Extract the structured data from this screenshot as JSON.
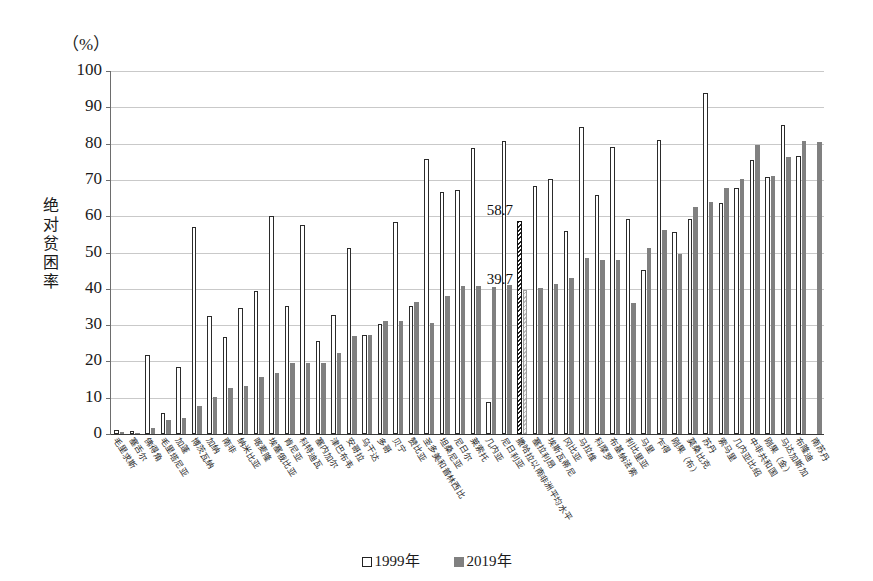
{
  "chart_data": {
    "type": "bar",
    "title": "",
    "unit_label": "（%）",
    "ylabel": "绝对贫困率",
    "xlabel": "",
    "ylim": [
      0,
      100
    ],
    "ytick_labels": [
      "0",
      "10",
      "20",
      "30",
      "40",
      "50",
      "60",
      "70",
      "80",
      "90",
      "100"
    ],
    "grid": true,
    "legend_position": "bottom",
    "legend": [
      "1999年",
      "2019年"
    ],
    "annotations": [
      {
        "category": "撒哈拉以南非洲平均水平",
        "series": "1999年",
        "value": 58.7,
        "text": "58.7"
      },
      {
        "category": "撒哈拉以南非洲平均水平",
        "series": "2019年",
        "value": 39.7,
        "text": "39.7"
      }
    ],
    "highlight_category": "撒哈拉以南非洲平均水平",
    "categories": [
      "毛里求斯",
      "塞舌尔",
      "佛得角",
      "毛里塔尼亚",
      "加蓬",
      "博茨瓦纳",
      "加纳",
      "南非",
      "纳米比亚",
      "喀麦隆",
      "埃塞俄比亚",
      "肯尼亚",
      "科特迪瓦",
      "塞内加尔",
      "津巴布韦",
      "安哥拉",
      "乌干达",
      "多哥",
      "贝宁",
      "赞比亚",
      "圣多美和普林西比",
      "坦桑尼亚",
      "尼日尔",
      "莱索托",
      "几内亚",
      "尼日利亚",
      "撒哈拉以南非洲平均水平",
      "塞拉利昂",
      "埃斯瓦蒂尼",
      "冈比亚",
      "马拉维",
      "科摩罗",
      "布基纳法索",
      "利比里亚",
      "马里",
      "乍得",
      "刚果（布）",
      "莫桑比克",
      "苏丹",
      "索马里",
      "几内亚比绍",
      "中非共和国",
      "刚果（金）",
      "马达加斯加",
      "布隆迪",
      "南苏丹"
    ],
    "series": [
      {
        "name": "1999年",
        "color": "#ffffff",
        "values": [
          1.0,
          0.8,
          21.9,
          5.7,
          18.5,
          56.9,
          32.5,
          26.8,
          34.6,
          39.4,
          60.1,
          35.2,
          57.5,
          25.6,
          32.7,
          51.3,
          27.4,
          30.2,
          58.3,
          35.2,
          75.8,
          66.6,
          67.2,
          78.9,
          8.9,
          80.6,
          58.7,
          68.2,
          70.3,
          55.8,
          84.5,
          65.8,
          79.1,
          59.1,
          45.3,
          81.1,
          55.6,
          59.2,
          93.9,
          63.7,
          67.8,
          75.6,
          70.8,
          85.0,
          76.5,
          null
        ]
      },
      {
        "name": "2019年",
        "color": "#808080",
        "values": [
          0.5,
          0.4,
          1.6,
          3.8,
          4.5,
          7.7,
          10.1,
          12.6,
          13.1,
          15.6,
          16.9,
          19.5,
          19.7,
          19.7,
          22.4,
          26.9,
          27.2,
          31.1,
          31.0,
          36.5,
          30.6,
          37.9,
          40.9,
          40.7,
          40.4,
          41.1,
          39.7,
          40.3,
          41.2,
          43.0,
          48.5,
          47.9,
          48.0,
          36.2,
          51.2,
          56.1,
          49.5,
          62.5,
          63.9,
          67.7,
          70.3,
          79.6,
          71.0,
          76.4,
          80.6,
          80.5
        ]
      }
    ]
  }
}
